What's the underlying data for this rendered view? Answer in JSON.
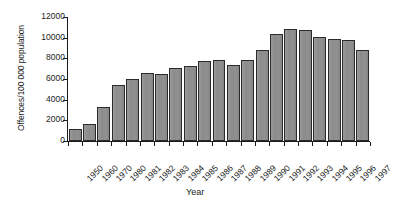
{
  "chart_data": {
    "type": "bar",
    "title": "",
    "xlabel": "Year",
    "ylabel": "Offences/100 000 population",
    "ylim": [
      0,
      12000
    ],
    "ytick_values": [
      0,
      2000,
      4000,
      6000,
      8000,
      10000,
      12000
    ],
    "ytick_labels": [
      "0",
      "2000",
      "4000",
      "6000",
      "8000",
      "10000",
      "12000"
    ],
    "grid": false,
    "legend": null,
    "categories": [
      "1950",
      "1960",
      "1970",
      "1980",
      "1981",
      "1982",
      "1983",
      "1984",
      "1985",
      "1986",
      "1987",
      "1988",
      "1989",
      "1990",
      "1991",
      "1992",
      "1993",
      "1994",
      "1995",
      "1996",
      "1997"
    ],
    "values": [
      1150,
      1600,
      3300,
      5450,
      6000,
      6550,
      6500,
      7050,
      7250,
      7750,
      7800,
      7400,
      7800,
      8800,
      10350,
      10800,
      10700,
      10100,
      9900,
      9750,
      8800
    ],
    "bar_color": "#8d8d8d",
    "bar_edge_color": "#2b2b2b",
    "axis_color": "#1a1a1a",
    "background_color": "#ffffff"
  }
}
